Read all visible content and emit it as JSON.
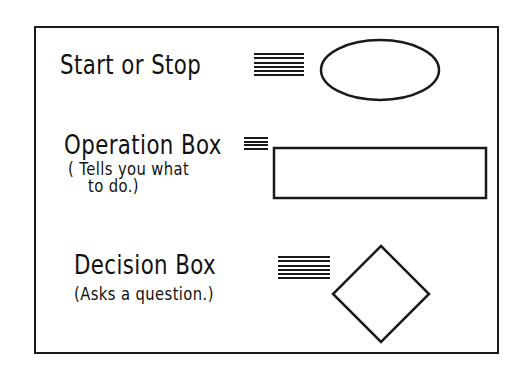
{
  "diagram": {
    "items": [
      {
        "label": "Start or Stop",
        "description": "",
        "shape": "ellipse",
        "connector": "equals-bars"
      },
      {
        "label": "Operation Box",
        "description_line1": "( Tells you what",
        "description_line2": "to do.)",
        "shape": "rectangle",
        "connector": "equals-bars"
      },
      {
        "label": "Decision Box",
        "description": "(Asks a question.)",
        "shape": "diamond",
        "connector": "equals-bars"
      }
    ],
    "colors": {
      "ink": "#1a1a1a",
      "background": "#ffffff"
    }
  }
}
